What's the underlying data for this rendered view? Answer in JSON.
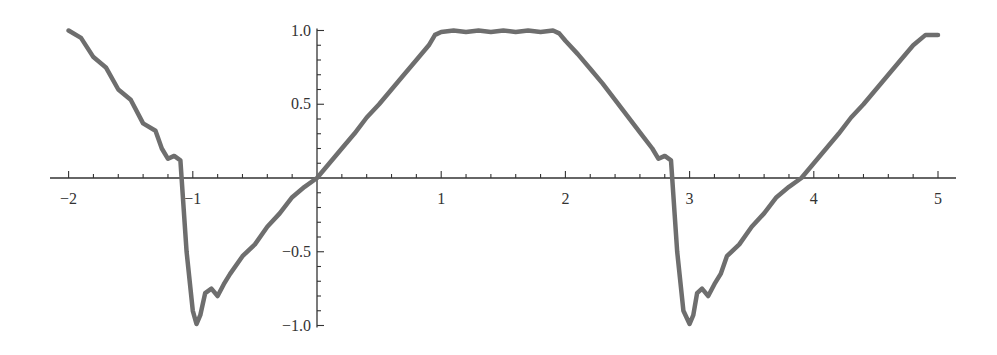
{
  "chart_data": {
    "type": "line",
    "title": "",
    "xlabel": "",
    "ylabel": "",
    "xlim": [
      -2.15,
      5.1
    ],
    "ylim": [
      -1.0,
      1.0
    ],
    "grid": false,
    "legend": null,
    "x_ticks": [
      {
        "value": -2,
        "label": "−2"
      },
      {
        "value": -1,
        "label": "−1"
      },
      {
        "value": 1,
        "label": "1"
      },
      {
        "value": 2,
        "label": "2"
      },
      {
        "value": 3,
        "label": "3"
      },
      {
        "value": 4,
        "label": "4"
      },
      {
        "value": 5,
        "label": "5"
      }
    ],
    "y_ticks": [
      {
        "value": 1.0,
        "label": "1.0"
      },
      {
        "value": 0.5,
        "label": "0.5"
      },
      {
        "value": -0.5,
        "label": "−0.5"
      },
      {
        "value": -1.0,
        "label": "−1.0"
      }
    ],
    "series": [
      {
        "name": "f(x)",
        "color": "#6e6e6e",
        "x": [
          -2.0,
          -1.9,
          -1.8,
          -1.7,
          -1.6,
          -1.5,
          -1.4,
          -1.3,
          -1.25,
          -1.2,
          -1.15,
          -1.1,
          -1.05,
          -1.0,
          -0.97,
          -0.94,
          -0.9,
          -0.85,
          -0.8,
          -0.75,
          -0.7,
          -0.6,
          -0.5,
          -0.4,
          -0.3,
          -0.2,
          -0.1,
          0.0,
          0.1,
          0.2,
          0.3,
          0.4,
          0.5,
          0.6,
          0.7,
          0.8,
          0.9,
          0.95,
          1.0,
          1.1,
          1.2,
          1.3,
          1.4,
          1.5,
          1.6,
          1.7,
          1.8,
          1.9,
          1.95,
          2.0,
          2.1,
          2.2,
          2.3,
          2.4,
          2.5,
          2.6,
          2.7,
          2.75,
          2.8,
          2.85,
          2.9,
          2.95,
          3.0,
          3.03,
          3.06,
          3.1,
          3.15,
          3.2,
          3.25,
          3.3,
          3.4,
          3.5,
          3.6,
          3.7,
          3.8,
          3.9,
          4.0,
          4.1,
          4.2,
          4.3,
          4.4,
          4.5,
          4.6,
          4.7,
          4.8,
          4.9,
          5.0
        ],
        "y": [
          1.0,
          0.95,
          0.82,
          0.75,
          0.6,
          0.53,
          0.37,
          0.32,
          0.2,
          0.13,
          0.15,
          0.12,
          -0.5,
          -0.9,
          -0.99,
          -0.93,
          -0.78,
          -0.75,
          -0.8,
          -0.72,
          -0.65,
          -0.53,
          -0.45,
          -0.33,
          -0.24,
          -0.13,
          -0.06,
          0.0,
          0.1,
          0.2,
          0.3,
          0.41,
          0.5,
          0.6,
          0.7,
          0.8,
          0.9,
          0.97,
          0.99,
          1.0,
          0.99,
          1.0,
          0.99,
          1.0,
          0.99,
          1.0,
          0.99,
          1.0,
          0.98,
          0.93,
          0.84,
          0.74,
          0.64,
          0.53,
          0.42,
          0.31,
          0.2,
          0.13,
          0.15,
          0.12,
          -0.5,
          -0.9,
          -0.99,
          -0.93,
          -0.78,
          -0.75,
          -0.8,
          -0.72,
          -0.65,
          -0.53,
          -0.45,
          -0.33,
          -0.24,
          -0.13,
          -0.06,
          0.0,
          0.1,
          0.2,
          0.3,
          0.41,
          0.5,
          0.6,
          0.7,
          0.8,
          0.9,
          0.97,
          0.97
        ]
      }
    ]
  }
}
